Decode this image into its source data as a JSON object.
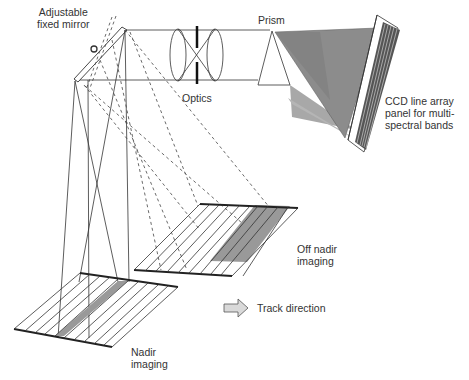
{
  "diagram": {
    "labels": {
      "mirror": [
        "Adjustable",
        "fixed mirror"
      ],
      "optics": "Optics",
      "prism": "Prism",
      "ccd": [
        "CCD line array",
        "panel for multi-",
        "spectral bands"
      ],
      "off_nadir": [
        "Off nadir",
        "imaging"
      ],
      "track": "Track direction",
      "nadir": [
        "Nadir",
        "imaging"
      ]
    },
    "colors": {
      "line": "#333333",
      "shade_dark": "#6e6e6e",
      "shade_mid": "#8c8c8c",
      "shade_light": "#a8a8a8",
      "strip_highlight": "#999999",
      "arrow_fill": "#d9d9d9"
    }
  }
}
